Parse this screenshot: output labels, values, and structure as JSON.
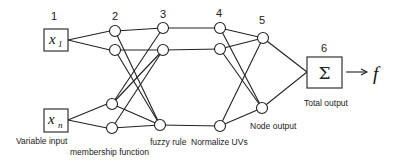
{
  "layers": [
    {
      "number": "1",
      "caption": "Variable input"
    },
    {
      "number": "2",
      "caption": "membership function"
    },
    {
      "number": "3",
      "caption": "fuzzy rule"
    },
    {
      "number": "4",
      "caption": "Normalize UVs"
    },
    {
      "number": "5",
      "caption": "Node output"
    },
    {
      "number": "6",
      "caption": "Total output"
    }
  ],
  "inputs": [
    {
      "symbol": "x",
      "subscript": "1"
    },
    {
      "symbol": "x",
      "subscript": "n"
    }
  ],
  "sum_symbol": "Σ",
  "output_symbol": "f",
  "arrow": "→"
}
